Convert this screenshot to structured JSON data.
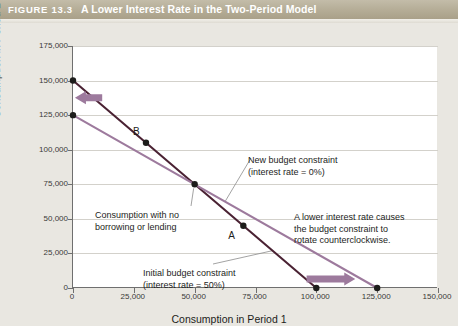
{
  "header": {
    "figure_number": "FIGURE 13.3",
    "title": "A Lower Interest Rate in the Two-Period Model",
    "bar_color": "#b6ae98",
    "text_color": "#ffffff"
  },
  "chart_data": {
    "type": "line",
    "title": "A Lower Interest Rate in the Two-Period Model",
    "xlabel": "Consumption in Period 1",
    "ylabel": "Consumption in Period 2",
    "xlim": [
      0,
      150000
    ],
    "ylim": [
      0,
      175000
    ],
    "xticks": [
      0,
      25000,
      50000,
      75000,
      100000,
      125000,
      150000
    ],
    "xticklabels": [
      "0",
      "25,000",
      "50,000",
      "75,000",
      "100,000",
      "125,000",
      "150,000"
    ],
    "yticks": [
      0,
      25000,
      50000,
      75000,
      100000,
      125000,
      150000,
      175000
    ],
    "yticklabels": [
      "0",
      "25,000",
      "50,000",
      "75,000",
      "100,000",
      "125,000",
      "150,000",
      "175,000"
    ],
    "grid": true,
    "grid_axis": "y",
    "legend": "none",
    "series": [
      {
        "name": "Initial budget constraint (interest rate = 50%)",
        "color": "#4a2233",
        "x": [
          0,
          50000,
          100000
        ],
        "y": [
          150000,
          75000,
          0
        ],
        "slope": -1.5,
        "intercept_y": 150000,
        "intercept_x": 100000
      },
      {
        "name": "New budget constraint (interest rate = 0%)",
        "color": "#9d7a9d",
        "x": [
          0,
          50000,
          125000
        ],
        "y": [
          125000,
          75000,
          0
        ],
        "slope": -1.0,
        "intercept_y": 125000,
        "intercept_x": 125000
      }
    ],
    "points": [
      {
        "label": "B",
        "x": 30000,
        "y": 105000,
        "color": "#1d1d1b",
        "label_pos": "above-left"
      },
      {
        "label": "A",
        "x": 70000,
        "y": 45000,
        "color": "#1d1d1b",
        "label_pos": "below-left"
      },
      {
        "label": "",
        "x": 50000,
        "y": 75000,
        "color": "#1d1d1b",
        "label_pos": "none"
      },
      {
        "label": "",
        "x": 0,
        "y": 150000,
        "color": "#1d1d1b",
        "label_pos": "none"
      },
      {
        "label": "",
        "x": 0,
        "y": 125000,
        "color": "#1d1d1b",
        "label_pos": "none"
      },
      {
        "label": "",
        "x": 100000,
        "y": 0,
        "color": "#1d1d1b",
        "label_pos": "none"
      },
      {
        "label": "",
        "x": 125000,
        "y": 0,
        "color": "#1d1d1b",
        "label_pos": "none"
      }
    ],
    "annotations": [
      {
        "id": "new-budget-constraint",
        "text": "New budget constraint\n(interest rate = 0%)",
        "leader": true
      },
      {
        "id": "initial-budget-constraint",
        "text": "Initial budget constraint\n(interest rate = 50%)",
        "leader": true
      },
      {
        "id": "no-borrowing-or-lending",
        "text": "Consumption with no\nborrowing or lending",
        "leader": true
      },
      {
        "id": "rotation-note",
        "text": "A lower interest rate causes\nthe budget constraint to\nrotate counterclockwise.",
        "leader": false
      }
    ],
    "arrows": [
      {
        "id": "vertical-intercept-shift-arrow",
        "direction": "left",
        "color": "#9d7a9d"
      },
      {
        "id": "horizontal-intercept-shift-arrow",
        "direction": "right",
        "color": "#9d7a9d"
      }
    ]
  }
}
